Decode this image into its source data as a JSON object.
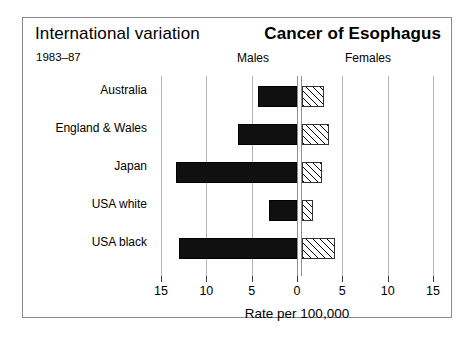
{
  "header": {
    "title_left": "International variation",
    "title_right": "Cancer of Esophagus",
    "period": "1983–87",
    "males_label": "Males",
    "females_label": "Females"
  },
  "colors": {
    "male_bar": "#101010",
    "female_bar_outline": "#333333",
    "gridline": "#b4b4b4",
    "frame": "#8a8a8a",
    "background": "#ffffff"
  },
  "chart_data": {
    "type": "bar",
    "orientation": "horizontal",
    "style": "population-pyramid",
    "title": "Cancer of Esophagus",
    "subtitle": "International variation",
    "period": "1983–87",
    "categories": [
      "Australia",
      "England & Wales",
      "Japan",
      "USA white",
      "USA black"
    ],
    "series": [
      {
        "name": "Males",
        "side": "left",
        "values": [
          4.3,
          6.5,
          13.3,
          3.1,
          13.0
        ]
      },
      {
        "name": "Females",
        "side": "right",
        "values": [
          2.4,
          3.0,
          2.2,
          1.2,
          3.6
        ]
      }
    ],
    "xlabel": "Rate per 100,000",
    "ylabel": "",
    "xlim": [
      -15,
      15
    ],
    "xticks": [
      -15,
      -10,
      -5,
      0,
      5,
      10,
      15
    ],
    "xtick_labels": [
      "15",
      "10",
      "5",
      "0",
      "5",
      "10",
      "15"
    ],
    "grid": true,
    "legend": "none"
  }
}
